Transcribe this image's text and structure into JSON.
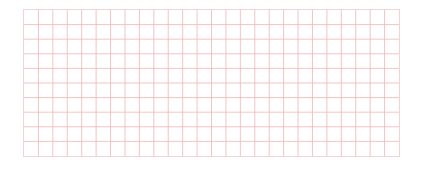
{
  "grid": {
    "columns": 26,
    "rows": 10,
    "line_color": "#f0b4b4",
    "frame_color": "#f3d4d4",
    "background": "#ffffff"
  }
}
